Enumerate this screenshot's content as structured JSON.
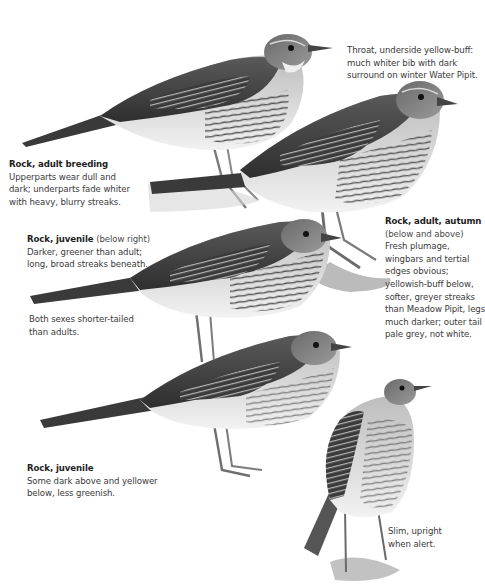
{
  "colors": {
    "background": "#ffffff",
    "text": "#3a3a3a",
    "title_text": "#1e1e1e",
    "plumage_dark": "#3c3c3c",
    "plumage_mid": "#7a7a7a",
    "plumage_light": "#d9d9d9",
    "underparts": "#ececec"
  },
  "captions": {
    "throat_note": {
      "lines": [
        "Throat, underside yellow-buff:",
        "much whiter bib with dark",
        "surround on winter Water Pipit."
      ]
    },
    "adult_breeding": {
      "title": "Rock, adult breeding",
      "lines": [
        "Upperparts wear dull and",
        "dark; underparts fade whiter",
        "with heavy, blurry streaks."
      ]
    },
    "juvenile_right": {
      "title": "Rock, juvenile",
      "title_suffix": " (below right)",
      "lines": [
        "Darker, greener than adult;",
        "long, broad streaks beneath."
      ]
    },
    "sexes_note": {
      "lines": [
        "Both sexes shorter-tailed",
        "than adults."
      ]
    },
    "adult_autumn": {
      "title": "Rock, adult, autumn",
      "lines": [
        "(below and above)",
        "Fresh plumage,",
        "wingbars and tertial",
        "edges obvious;",
        "yellowish-buff below,",
        "softer, greyer streaks",
        "than Meadow Pipit, legs",
        "much darker; outer tail",
        "pale grey, not white."
      ]
    },
    "juvenile_lower": {
      "title": "Rock, juvenile",
      "lines": [
        "Some dark above and yellower",
        "below, less greenish."
      ]
    },
    "upright_note": {
      "lines": [
        "Slim, upright",
        "when alert."
      ]
    }
  },
  "illustrations": [
    {
      "id": "adult-breeding-bird",
      "subject": "Rock Pipit, adult breeding"
    },
    {
      "id": "adult-autumn-bird-upper",
      "subject": "Rock Pipit, adult autumn"
    },
    {
      "id": "juvenile-bird-middle",
      "subject": "Rock Pipit, juvenile"
    },
    {
      "id": "juvenile-bird-lower",
      "subject": "Rock Pipit, juvenile"
    },
    {
      "id": "upright-bird",
      "subject": "Rock Pipit, upright alert posture"
    }
  ]
}
